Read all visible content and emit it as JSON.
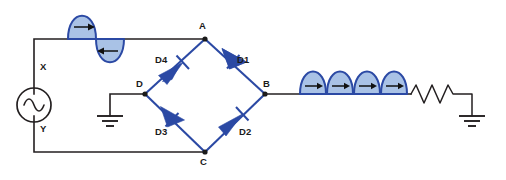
{
  "figure": {
    "background_color": "#ffffff",
    "wire_color": "#231f20",
    "diode_color": "#2b49a4",
    "wave_fill_color": "#a9c2e6"
  },
  "source": {
    "type": "ac-voltage-source",
    "terminal_top_label": "X",
    "terminal_bottom_label": "Y",
    "symbol": "sine-wave-in-circle"
  },
  "nodes": [
    {
      "id": "A",
      "label": "A",
      "position": "bridge-top"
    },
    {
      "id": "B",
      "label": "B",
      "position": "bridge-right"
    },
    {
      "id": "C",
      "label": "C",
      "position": "bridge-bottom"
    },
    {
      "id": "D",
      "label": "D",
      "position": "bridge-left"
    }
  ],
  "diodes": [
    {
      "id": "D1",
      "label": "D1",
      "from": "A",
      "to": "B",
      "direction": "down-right"
    },
    {
      "id": "D2",
      "label": "D2",
      "from": "C",
      "to": "B",
      "direction": "up-right"
    },
    {
      "id": "D3",
      "label": "D3",
      "from": "D",
      "to": "C",
      "direction": "down-right"
    },
    {
      "id": "D4",
      "label": "D4",
      "from": "D",
      "to": "A",
      "direction": "up-right"
    }
  ],
  "waveforms": {
    "input": {
      "name": "input-ac-waveform",
      "description": "full sine wave, one positive lobe then one negative lobe",
      "lobes": 2,
      "lobe_polarity": [
        "positive",
        "negative"
      ],
      "arrow_directions": [
        "right",
        "left"
      ]
    },
    "output": {
      "name": "output-rectified-waveform",
      "description": "four positive half-sine humps",
      "lobes": 4,
      "lobe_polarity": [
        "positive",
        "positive",
        "positive",
        "positive"
      ],
      "arrow_directions": [
        "right",
        "right",
        "right",
        "right"
      ]
    }
  },
  "load": {
    "name": "load-resistor",
    "symbol": "zigzag-resistor",
    "label": ""
  },
  "grounds": [
    {
      "id": "ground-d",
      "connected_to": "D"
    },
    {
      "id": "ground-load",
      "connected_to": "load-resistor"
    }
  ]
}
